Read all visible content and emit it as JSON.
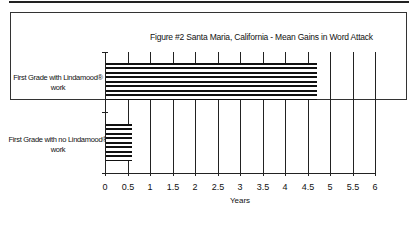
{
  "chart_data": {
    "type": "bar",
    "orientation": "horizontal",
    "title": "Figure #2  Santa Maria, California - Mean Gains in Word Attack",
    "categories": [
      "First Grade with Lindamood® work",
      "First Grade with no Lindamood® work"
    ],
    "values": [
      4.7,
      0.6
    ],
    "xlabel": "Years",
    "ylabel": "",
    "xlim": [
      0,
      6
    ],
    "xticks": [
      "0",
      "0.5",
      "1",
      "1.5",
      "2",
      "2.5",
      "3",
      "3.5",
      "4",
      "4.5",
      "5",
      "5.5",
      "6"
    ],
    "grid": "vertical",
    "legend": "none",
    "bar_fill": "horizontal stripes black/white"
  },
  "labels": {
    "title": "Figure #2  Santa Maria, California - Mean Gains in Word Attack",
    "cat1_line1": "First Grade with Lindamood®",
    "cat1_line2": "work",
    "cat2_line1": "First Grade with no Lindamood®",
    "cat2_line2": "work",
    "xlabel": "Years"
  }
}
